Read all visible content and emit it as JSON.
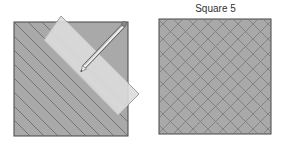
{
  "figure": {
    "left_panel": {
      "label": "",
      "description": "Square with diagonal parallel lines, ruler and pencil drawing a line",
      "fill_color": "#a8a8a8",
      "line_color": "#6a6a6a",
      "ruler_color": "#dedede",
      "pencil": "pencil-icon"
    },
    "right_panel": {
      "label": "Square 5",
      "description": "Square with crosshatched diagonal grid",
      "fill_color": "#a8a8a8",
      "line_color": "#7a7a7a"
    }
  }
}
